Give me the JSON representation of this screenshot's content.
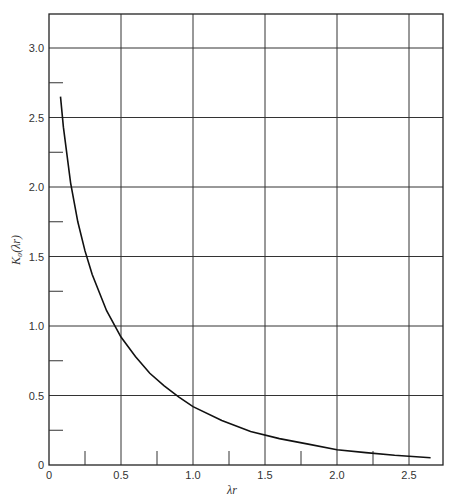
{
  "chart_data": {
    "type": "line",
    "title": "",
    "xlabel": "λr",
    "ylabel": "K₀(λr)",
    "xlim": [
      0,
      2.75
    ],
    "ylim": [
      0,
      3.25
    ],
    "grid": true,
    "x_ticks": [
      "0",
      "0.5",
      "1.0",
      "1.5",
      "2.0",
      "2.5"
    ],
    "y_ticks": [
      "0",
      "0.5",
      "1.0",
      "1.5",
      "2.0",
      "2.5",
      "3.0"
    ],
    "series": [
      {
        "name": "K0(λr)",
        "x": [
          0.08,
          0.1,
          0.15,
          0.2,
          0.25,
          0.3,
          0.4,
          0.5,
          0.6,
          0.7,
          0.8,
          0.9,
          1.0,
          1.2,
          1.4,
          1.6,
          1.8,
          2.0,
          2.2,
          2.4,
          2.65
        ],
        "values": [
          2.65,
          2.43,
          2.03,
          1.75,
          1.54,
          1.37,
          1.11,
          0.92,
          0.78,
          0.66,
          0.57,
          0.49,
          0.42,
          0.32,
          0.24,
          0.19,
          0.15,
          0.11,
          0.089,
          0.07,
          0.052
        ]
      }
    ]
  }
}
